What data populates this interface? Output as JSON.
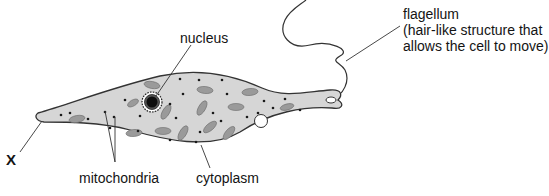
{
  "diagram": {
    "labels": {
      "nucleus": "nucleus",
      "flagellum_title": "flagellum",
      "flagellum_desc_line1": "(hair-like structure that",
      "flagellum_desc_line2": "allows the cell to move)",
      "x_marker": "X",
      "mitochondria": "mitochondria",
      "cytoplasm": "cytoplasm"
    },
    "colors": {
      "cytoplasm_fill": "#d6d6d6",
      "outline": "#333333",
      "organelle": "#9a9a9a",
      "dot": "#1a1a1a",
      "vacuole": "#ffffff"
    }
  }
}
